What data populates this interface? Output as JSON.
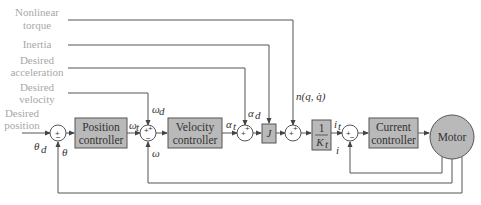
{
  "inputs": {
    "nonlinear_torque": [
      "Nonlinear",
      "torque"
    ],
    "inertia": [
      "Inertia"
    ],
    "desired_acceleration": [
      "Desired",
      "acceleration"
    ],
    "desired_velocity": [
      "Desired",
      "velocity"
    ],
    "desired_position": [
      "Desired",
      "position"
    ]
  },
  "blocks": {
    "position_controller": [
      "Position",
      "controller"
    ],
    "velocity_controller": [
      "Velocity",
      "controller"
    ],
    "inertia_gain": "J",
    "torque_gain": {
      "num": "1",
      "den": "K",
      "den_sub": "t"
    },
    "current_controller": [
      "Current",
      "controller"
    ],
    "motor": "Motor"
  },
  "signals": {
    "theta_d": "θ",
    "theta_d_sub": "d",
    "theta": "θ",
    "omega_t": "ω",
    "omega_t_sub": "t",
    "omega_d": "ω",
    "omega_d_sub": "d",
    "omega": "ω",
    "alpha_t": "α",
    "alpha_t_sub": "t",
    "alpha_d": "α",
    "alpha_d_sub": "d",
    "nonlinear": "n(q, q̇)",
    "i_t": "i",
    "i_t_sub": "t",
    "i": "i"
  },
  "signs": {
    "plus": "+",
    "minus": "−"
  },
  "colors": {
    "block_fill": "#b9b9b9",
    "block_stroke": "#555555",
    "line": "#555555",
    "label": "#a8a8a8",
    "text": "#333333"
  }
}
